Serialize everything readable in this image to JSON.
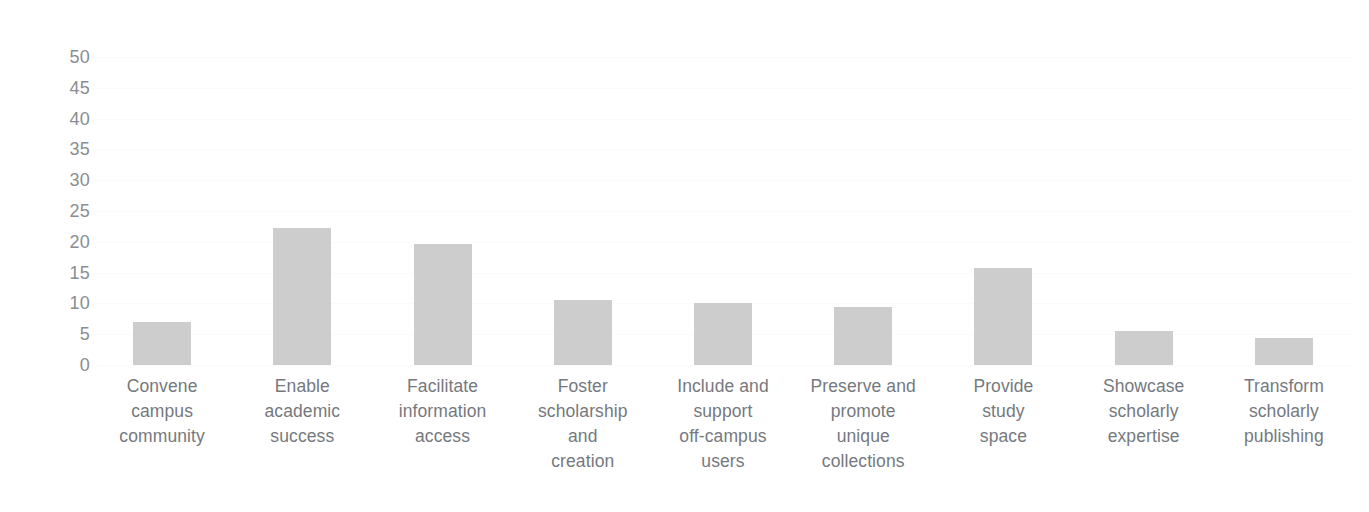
{
  "chart_data": {
    "type": "bar",
    "title": "",
    "subtitle": "",
    "xlabel": "",
    "ylabel": "",
    "ylim": [
      0,
      50
    ],
    "yticks": [
      0,
      5,
      10,
      15,
      20,
      25,
      30,
      35,
      40,
      45,
      50
    ],
    "ytick_labels": [
      "0",
      "5",
      "10",
      "15",
      "20",
      "25",
      "30",
      "35",
      "40",
      "45",
      "50"
    ],
    "grid": true,
    "legend": false,
    "legend_position": "none",
    "bar_color": "#cdcdcd",
    "background_color": "#ffffff",
    "text_color": "#75797e",
    "categories": [
      "Convene campus community",
      "Enable academic success",
      "Facilitate information access",
      "Foster scholarship and creation",
      "Include and support off-campus users",
      "Preserve and promote unique collections",
      "Provide study space",
      "Showcase scholarly expertise",
      "Transform scholarly publishing"
    ],
    "category_label_lines": [
      "Convene\ncampus\ncommunity",
      "Enable\nacademic\nsuccess",
      "Facilitate\ninformation\naccess",
      "Foster\nscholarship\nand\ncreation",
      "Include and\nsupport\noff-campus\nusers",
      "Preserve and\npromote\nunique\ncollections",
      "Provide\nstudy\nspace",
      "Showcase\nscholarly\nexpertise",
      "Transform\nscholarly\npublishing"
    ],
    "values": [
      7,
      22.3,
      19.6,
      10.6,
      10,
      9.4,
      15.7,
      5.6,
      4.4
    ]
  }
}
